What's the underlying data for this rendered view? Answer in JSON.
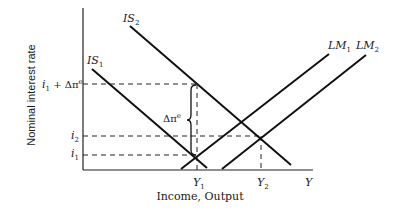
{
  "diagram": {
    "type": "IS-LM shift diagram",
    "y_axis_title": "Nominal interest rate",
    "x_axis_title": "Income, Output",
    "x_axis_end_label": "Y",
    "curves": [
      {
        "id": "IS1",
        "label": "IS",
        "subscript": "1"
      },
      {
        "id": "IS2",
        "label": "IS",
        "subscript": "2"
      },
      {
        "id": "LM1",
        "label": "LM",
        "subscript": "1"
      },
      {
        "id": "LM2",
        "label": "LM",
        "subscript": "2"
      }
    ],
    "y_ticks": [
      {
        "id": "i1_plus",
        "label": "i",
        "subscript": "1",
        "suffix": " + Δπ",
        "superscript": "e"
      },
      {
        "id": "i2",
        "label": "i",
        "subscript": "2"
      },
      {
        "id": "i1",
        "label": "i",
        "subscript": "1"
      }
    ],
    "x_ticks": [
      {
        "id": "Y1",
        "label": "Y",
        "subscript": "1"
      },
      {
        "id": "Y2",
        "label": "Y",
        "subscript": "2"
      }
    ],
    "brace_label": {
      "text": "Δπ",
      "superscript": "e"
    },
    "colors": {
      "line": "#111111",
      "background": "#ffffff"
    }
  }
}
